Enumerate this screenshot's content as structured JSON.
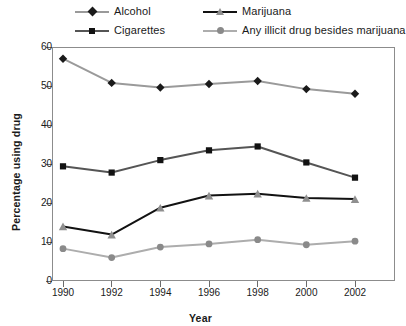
{
  "chart_data": {
    "type": "line",
    "title": "",
    "xlabel": "Year",
    "ylabel": "Percentage using drug",
    "categories": [
      "1990",
      "1992",
      "1994",
      "1996",
      "1998",
      "2000",
      "2002"
    ],
    "x": [
      1990,
      1992,
      1994,
      1996,
      1998,
      2000,
      2002
    ],
    "xlim": [
      1989,
      2003
    ],
    "ylim": [
      0,
      60
    ],
    "yticks": [
      0,
      10,
      20,
      30,
      40,
      50,
      60
    ],
    "ytick_labels": [
      "0",
      "10",
      "20",
      "30",
      "40",
      "50",
      "60"
    ],
    "grid": false,
    "legend_position": "top",
    "series": [
      {
        "name": "Alcohol",
        "values": [
          57.0,
          50.8,
          49.6,
          50.5,
          51.3,
          49.2,
          48.0
        ],
        "line_color": "#9a9a9a",
        "marker": "diamond",
        "marker_color": "#1a1a1a"
      },
      {
        "name": "Cigarettes",
        "values": [
          29.4,
          27.8,
          31.0,
          33.5,
          34.5,
          30.4,
          26.5
        ],
        "line_color": "#555555",
        "marker": "square",
        "marker_color": "#121212"
      },
      {
        "name": "Marijuana",
        "values": [
          14.0,
          11.9,
          18.8,
          21.9,
          22.4,
          21.3,
          21.0
        ],
        "line_color": "#121212",
        "marker": "triangle",
        "marker_color": "#8f8f8f"
      },
      {
        "name": "Any illicit drug besides marijuana",
        "values": [
          8.3,
          6.0,
          8.7,
          9.5,
          10.6,
          9.3,
          10.2
        ],
        "line_color": "#adadad",
        "marker": "circle",
        "marker_color": "#8a8a8a"
      }
    ]
  },
  "legend": {
    "items": [
      {
        "label": "Alcohol"
      },
      {
        "label": "Cigarettes"
      },
      {
        "label": "Marijuana"
      },
      {
        "label": "Any illicit drug besides marijuana"
      }
    ]
  },
  "colors": {
    "axis": "#6b6b6b",
    "frame": "#8c8c8c",
    "text": "#1a1a1a",
    "background": "#ffffff"
  }
}
